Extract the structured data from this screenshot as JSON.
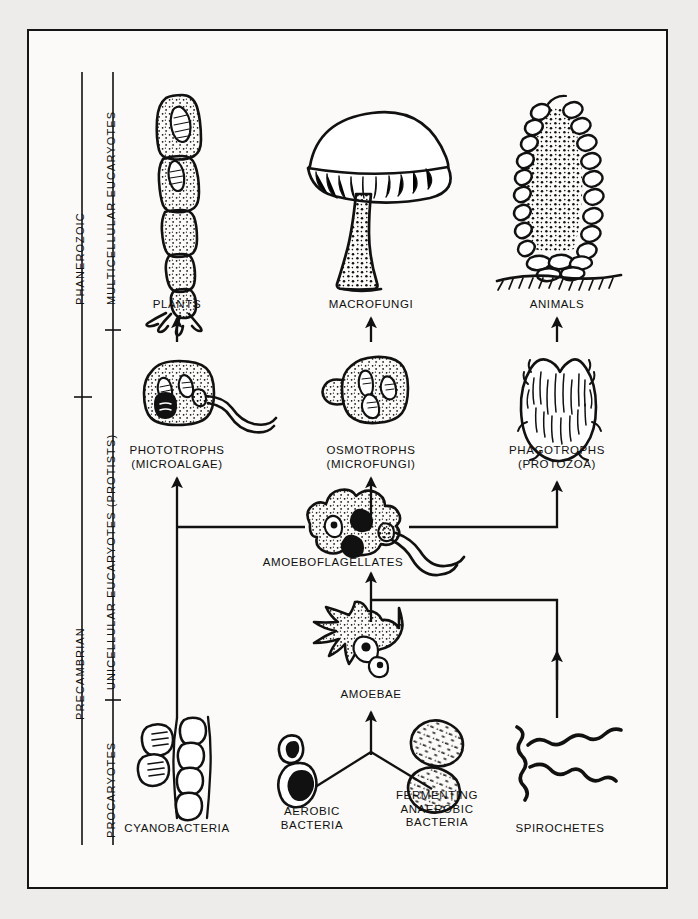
{
  "figure": {
    "background_color": "#eeeceb",
    "panel_color": "#fbfaf8",
    "ink_color": "#111111"
  },
  "eras": [
    {
      "name": "era-phanerozoic",
      "label": "PHANEROZOIC"
    },
    {
      "name": "era-precambrian",
      "label": "PRECAMBRIAN"
    }
  ],
  "grades": [
    {
      "name": "grade-multicellular",
      "label": "MULTICELLULAR  EUCARYOTES"
    },
    {
      "name": "grade-unicellular",
      "label": "UNICELLULAR EUCARYOTES (PROTISTS)"
    },
    {
      "name": "grade-procaryotes",
      "label": "PROCARYOTES"
    }
  ],
  "nodes": [
    {
      "name": "node-plants",
      "label": "PLANTS",
      "row": "multicellular",
      "icon": "filamentous-alga-icon"
    },
    {
      "name": "node-macrofungi",
      "label": "MACROFUNGI",
      "row": "multicellular",
      "icon": "mushroom-icon"
    },
    {
      "name": "node-animals",
      "label": "ANIMALS",
      "row": "multicellular",
      "icon": "sponge-icon"
    },
    {
      "name": "node-phototrophs",
      "label": "PHOTOTROPHS\n(MICROALGAE)",
      "row": "protist",
      "icon": "flagellated-algal-cell-icon"
    },
    {
      "name": "node-osmotrophs",
      "label": "OSMOTROPHS\n(MICROFUNGI)",
      "row": "protist",
      "icon": "budding-fungal-cell-icon"
    },
    {
      "name": "node-phagotrophs",
      "label": "PHAGOTROPHS\n(PROTOZOA)",
      "row": "protist",
      "icon": "ciliate-icon"
    },
    {
      "name": "node-amoeboflagellates",
      "label": "AMOEBOFLAGELLATES",
      "row": "protist",
      "icon": "amoeboflagellate-icon"
    },
    {
      "name": "node-amoebae",
      "label": "AMOEBAE",
      "row": "protist",
      "icon": "amoeba-icon"
    },
    {
      "name": "node-cyanobacteria",
      "label": "CYANOBACTERIA",
      "row": "procaryote",
      "icon": "cyanobacteria-icon"
    },
    {
      "name": "node-aerobic-bacteria",
      "label": "AEROBIC\nBACTERIA",
      "row": "procaryote",
      "icon": "aerobic-bacteria-icon"
    },
    {
      "name": "node-fermenting-bacteria",
      "label": "FERMENTING\nANAEROBIC\nBACTERIA",
      "row": "procaryote",
      "icon": "fermenting-bacteria-icon"
    },
    {
      "name": "node-spirochetes",
      "label": "SPIROCHETES",
      "row": "procaryote",
      "icon": "spirochete-icon"
    }
  ],
  "connections": [
    {
      "name": "link-phototrophs-to-plants",
      "from": "node-phototrophs",
      "to": "node-plants"
    },
    {
      "name": "link-osmotrophs-to-macrofungi",
      "from": "node-osmotrophs",
      "to": "node-macrofungi"
    },
    {
      "name": "link-phagotrophs-to-animals",
      "from": "node-phagotrophs",
      "to": "node-animals"
    },
    {
      "name": "link-cyanobacteria-to-phototrophs",
      "from": "node-cyanobacteria",
      "to": "node-phototrophs"
    },
    {
      "name": "link-amoeboflagellates-to-phototrophs",
      "from": "node-amoeboflagellates",
      "to": "node-phototrophs"
    },
    {
      "name": "link-amoeboflagellates-to-osmotrophs",
      "from": "node-amoeboflagellates",
      "to": "node-osmotrophs"
    },
    {
      "name": "link-amoeboflagellates-to-phagotrophs",
      "from": "node-amoeboflagellates",
      "to": "node-phagotrophs"
    },
    {
      "name": "link-amoebae-to-amoeboflagellates",
      "from": "node-amoebae",
      "to": "node-amoeboflagellates"
    },
    {
      "name": "link-spirochetes-to-amoeboflagellates",
      "from": "node-spirochetes",
      "to": "node-amoeboflagellates"
    },
    {
      "name": "link-aerobic-to-amoebae",
      "from": "node-aerobic-bacteria",
      "to": "node-amoebae"
    },
    {
      "name": "link-fermenting-to-amoebae",
      "from": "node-fermenting-bacteria",
      "to": "node-amoebae"
    }
  ]
}
